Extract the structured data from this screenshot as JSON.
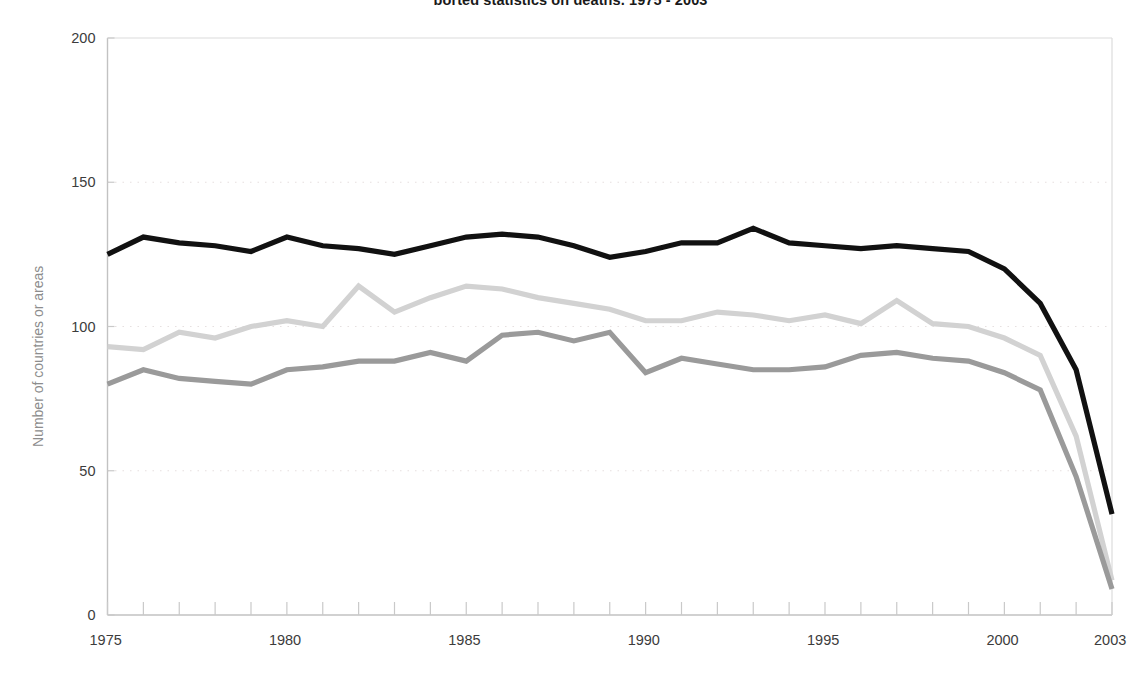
{
  "chart_data": {
    "type": "line",
    "title": "ported statistics on deaths, 1975 - 2003",
    "xlabel": "",
    "ylabel": "Number of countries or areas",
    "xlim": [
      1975,
      2003
    ],
    "ylim": [
      0,
      200
    ],
    "y_ticks": [
      0,
      50,
      100,
      150,
      200
    ],
    "x_ticks": [
      1975,
      1980,
      1985,
      1990,
      1995,
      2000,
      2003
    ],
    "x_tick_labels": [
      "1975",
      "1980",
      "1985",
      "1990",
      "1995",
      "2000",
      "2003"
    ],
    "y_tick_labels": [
      "0",
      "50",
      "100",
      "150",
      "200"
    ],
    "grid": "horizontal-dotted",
    "legend": "none",
    "x": [
      1975,
      1976,
      1977,
      1978,
      1979,
      1980,
      1981,
      1982,
      1983,
      1984,
      1985,
      1986,
      1987,
      1988,
      1989,
      1990,
      1991,
      1992,
      1993,
      1994,
      1995,
      1996,
      1997,
      1998,
      1999,
      2000,
      2001,
      2002,
      2003
    ],
    "series": [
      {
        "name": "series-black",
        "color": "#111111",
        "values": [
          125,
          131,
          129,
          128,
          126,
          131,
          128,
          127,
          125,
          128,
          131,
          132,
          131,
          128,
          124,
          126,
          129,
          129,
          134,
          129,
          128,
          127,
          128,
          127,
          126,
          120,
          108,
          85,
          35
        ]
      },
      {
        "name": "series-light-gray",
        "color": "#d2d2d2",
        "values": [
          93,
          92,
          98,
          96,
          100,
          102,
          100,
          114,
          105,
          110,
          114,
          113,
          110,
          108,
          106,
          102,
          102,
          105,
          104,
          102,
          104,
          101,
          109,
          101,
          100,
          96,
          90,
          62,
          12
        ]
      },
      {
        "name": "series-medium-gray",
        "color": "#9a9a9a",
        "values": [
          80,
          85,
          82,
          81,
          80,
          85,
          86,
          88,
          88,
          91,
          88,
          97,
          98,
          95,
          98,
          84,
          89,
          87,
          85,
          85,
          86,
          90,
          91,
          89,
          88,
          84,
          78,
          48,
          9
        ]
      }
    ]
  },
  "axes": {
    "y_label_text": "Number of countries or areas"
  }
}
